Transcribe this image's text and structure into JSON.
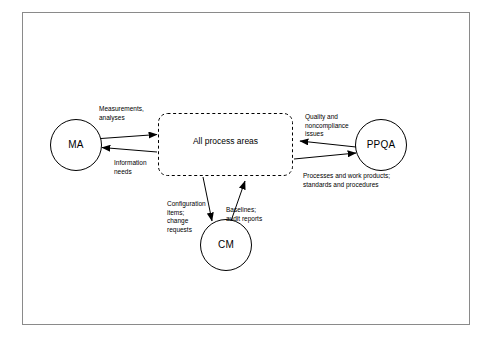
{
  "diagram": {
    "center_box": {
      "label": "All process areas",
      "border_style": "dashed",
      "border_color": "#000000"
    },
    "nodes": [
      {
        "id": "ma",
        "label": "MA",
        "shape": "circle"
      },
      {
        "id": "ppqa",
        "label": "PPQA",
        "shape": "circle"
      },
      {
        "id": "cm",
        "label": "CM",
        "shape": "circle"
      }
    ],
    "edge_labels": [
      {
        "id": "ma-out",
        "text": "Measurements,\nanalyses"
      },
      {
        "id": "ma-in",
        "text": "Information\nneeds"
      },
      {
        "id": "ppqa-out",
        "text": "Quality and\nnoncompliance\nissues"
      },
      {
        "id": "ppqa-in",
        "text": "Processes and work products;\nstandards and procedures"
      },
      {
        "id": "cm-out",
        "text": "Configuration\nitems;\nchange\nrequests"
      },
      {
        "id": "cm-in",
        "text": "Baselines;\naudit reports"
      }
    ],
    "colors": {
      "stroke": "#000000",
      "frame": "#8a8a8a",
      "background": "#ffffff"
    }
  }
}
